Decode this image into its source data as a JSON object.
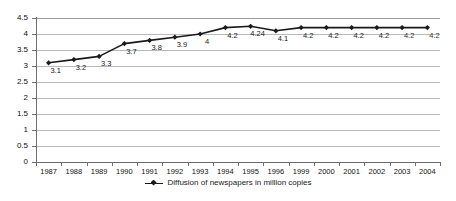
{
  "chart_data": {
    "type": "line",
    "title": "",
    "subtitle": "",
    "xlabel": "",
    "ylabel": "",
    "categories": [
      "1987",
      "1988",
      "1989",
      "1990",
      "1991",
      "1992",
      "1993",
      "1994",
      "1995",
      "1996",
      "1999",
      "2000",
      "2001",
      "2002",
      "2003",
      "2004"
    ],
    "values": [
      3.1,
      3.2,
      3.3,
      3.7,
      3.8,
      3.9,
      4,
      4.2,
      4.24,
      4.1,
      4.2,
      4.2,
      4.2,
      4.2,
      4.2,
      4.2
    ],
    "point_labels": [
      "3.1",
      "3.2",
      "3.3",
      "3.7",
      "3.8",
      "3.9",
      "4",
      "4.2",
      "4.24",
      "4.1",
      "4.2",
      "4.2",
      "4.2",
      "4.2",
      "4.2",
      "4.2"
    ],
    "ylim": [
      0,
      4.5
    ],
    "yticks": [
      0,
      0.5,
      1,
      1.5,
      2,
      2.5,
      3,
      3.5,
      4,
      4.5
    ],
    "ytick_labels": [
      "0",
      "0.5",
      "1",
      "1.5",
      "2",
      "2.5",
      "3",
      "3.5",
      "4",
      "4.5"
    ],
    "grid": true,
    "grid_axis": "y",
    "legend_position": "bottom",
    "series": [
      {
        "name": "Diffusion of newspapers in million copies",
        "color": "#1a1a1a",
        "marker": "diamond",
        "values": [
          3.1,
          3.2,
          3.3,
          3.7,
          3.8,
          3.9,
          4,
          4.2,
          4.24,
          4.1,
          4.2,
          4.2,
          4.2,
          4.2,
          4.2,
          4.2
        ]
      }
    ]
  },
  "legend": {
    "marker_name": "line-diamond-marker",
    "label": "Diffusion of newspapers in million copies"
  },
  "colors": {
    "series": "#1a1a1a",
    "grid": "#b9b9b9",
    "axis": "#6e6e6e",
    "background": "#ffffff",
    "text": "#1a1a1a"
  }
}
